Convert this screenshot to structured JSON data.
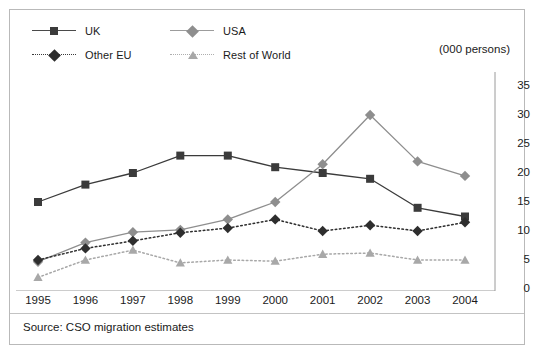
{
  "figure": {
    "units_label": "(000 persons)",
    "source_note": "Source: CSO migration estimates"
  },
  "legend": {
    "items": [
      {
        "label": "UK",
        "marker": "square-marker",
        "line": "solid",
        "color": "#3b3b3b"
      },
      {
        "label": "USA",
        "marker": "diamond-marker",
        "line": "solid",
        "color": "#8e8e8e"
      },
      {
        "label": "Other EU",
        "marker": "diamond-marker",
        "line": "dotted",
        "color": "#2e2e2e"
      },
      {
        "label": "Rest of World",
        "marker": "triangle-marker",
        "line": "dotted",
        "color": "#a8a8a8"
      }
    ]
  },
  "chart_data": {
    "type": "line",
    "title": "",
    "subtitle": "",
    "xlabel": "",
    "ylabel": "(000 persons)",
    "categories": [
      "1995",
      "1996",
      "1997",
      "1998",
      "1999",
      "2000",
      "2001",
      "2002",
      "2003",
      "2004"
    ],
    "ylim": [
      0,
      35
    ],
    "yticks": [
      0,
      5,
      10,
      15,
      20,
      25,
      30,
      35
    ],
    "grid": false,
    "legend_position": "top-left",
    "axis_position": "right",
    "series": [
      {
        "name": "UK",
        "color": "#3b3b3b",
        "line_style": "solid",
        "marker": "square",
        "values": [
          15,
          18,
          20,
          23,
          23,
          21,
          20,
          19,
          14,
          12.5
        ]
      },
      {
        "name": "USA",
        "color": "#8e8e8e",
        "line_style": "solid",
        "marker": "diamond",
        "values": [
          4.7,
          8,
          9.8,
          10.2,
          12,
          15,
          21.5,
          30,
          22,
          19.5
        ]
      },
      {
        "name": "Other EU",
        "color": "#2e2e2e",
        "line_style": "dotted",
        "marker": "diamond",
        "values": [
          5,
          7,
          8.3,
          9.7,
          10.5,
          12,
          10,
          11,
          10,
          11.5
        ]
      },
      {
        "name": "Rest of World",
        "color": "#a8a8a8",
        "line_style": "dotted",
        "marker": "triangle",
        "values": [
          2,
          5,
          6.7,
          4.5,
          5,
          4.8,
          6,
          6.2,
          5,
          5
        ]
      }
    ]
  }
}
